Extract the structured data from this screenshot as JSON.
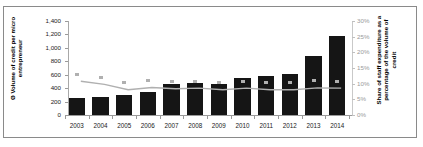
{
  "chart_data": {
    "type": "bar",
    "title": "",
    "categories": [
      "2003",
      "2004",
      "2005",
      "2006",
      "2007",
      "2008",
      "2009",
      "2010",
      "2011",
      "2012",
      "2013",
      "2014"
    ],
    "series": [
      {
        "name": "Ø Volume of credit per micro entrepreneur",
        "type": "bar",
        "axis": "left",
        "color": "#151515",
        "values": [
          258,
          275,
          295,
          348,
          462,
          478,
          468,
          553,
          588,
          613,
          878,
          1180
        ]
      },
      {
        "name": "Share of staff expenditure as a percentage of the volume of credit",
        "type": "line",
        "axis": "right",
        "color": "#b0b0b0",
        "values": [
          13.0,
          12.0,
          10.3,
          11.0,
          10.6,
          10.8,
          10.3,
          10.8,
          10.3,
          10.3,
          10.9,
          10.8
        ]
      }
    ],
    "ylabel": "Ø Volume of credit per micro entrepreneur",
    "ylabel_right": "Share of staff expenditure as a percentage of the volume of credit",
    "xlabel": "",
    "ylim": [
      0,
      1400
    ],
    "ylim_right": [
      0,
      30
    ],
    "yticks": [
      "0",
      "200",
      "400",
      "600",
      "800",
      "1,000",
      "1,200",
      "1,400"
    ],
    "ytick_values": [
      0,
      200,
      400,
      600,
      800,
      1000,
      1200,
      1400
    ],
    "yticks_right": [
      "0%",
      "5%",
      "10%",
      "15%",
      "20%",
      "25%",
      "30%"
    ],
    "ytick_values_right": [
      0,
      5,
      10,
      15,
      20,
      25,
      30
    ],
    "grid": false,
    "legend": "none"
  },
  "axes": {
    "left_title": "Ø Volume of credit per micro\nentrepreneur",
    "right_title": "Share of staff expenditure as a\npercentage of the volume of\ncredit"
  },
  "colors": {
    "bar": "#151515",
    "line": "#b0b0b0",
    "frame": "#8a8a8a",
    "axis": "#9a9a9a",
    "right_axis_text": "#9a9a9a",
    "background": "#ffffff"
  }
}
